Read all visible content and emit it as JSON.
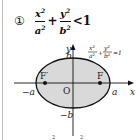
{
  "item_number": "①",
  "inequality": {
    "term1_num": "x",
    "term1_den": "a",
    "plus": "+",
    "term2_num": "y",
    "term2_den": "b",
    "relation": "<1",
    "exp": "2"
  },
  "graph": {
    "curve_label": "x²/a² + y²/b² = 1",
    "curve_num1": "x²",
    "curve_den1": "a²",
    "curve_plus": "+",
    "curve_num2": "y²",
    "curve_den2": "b²",
    "curve_eq": "=1",
    "y_axis": "y",
    "x_axis": "x",
    "origin": "O",
    "b_label": "b",
    "neg_b_label": "−b",
    "a_label": "a",
    "neg_a_label": "−a",
    "focus_left": "F′",
    "focus_right": "F",
    "fill_color": "#d9d9d9",
    "stroke_color": "#111111"
  },
  "footer_partial": "2        2"
}
